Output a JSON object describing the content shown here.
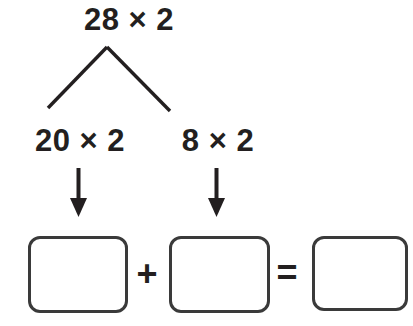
{
  "worksheet": {
    "title": "partition-multiplication-number-bond",
    "background_color": "#ffffff",
    "ink_color": "#231f20",
    "box_border_color": "#3a3a3a"
  },
  "problem": {
    "root_expression": "28 × 2",
    "branches": [
      {
        "expression": "20 × 2"
      },
      {
        "expression": "8 × 2"
      }
    ],
    "operators": {
      "plus": "+",
      "equals": "="
    },
    "answer_boxes": [
      {
        "name": "first-partial-product",
        "value": ""
      },
      {
        "name": "second-partial-product",
        "value": ""
      },
      {
        "name": "total-product",
        "value": ""
      }
    ]
  }
}
